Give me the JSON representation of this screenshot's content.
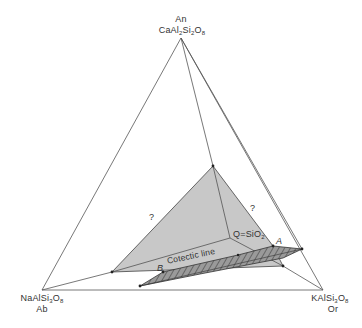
{
  "diagram": {
    "type": "ternary-phase-diagram",
    "apexes": {
      "top": {
        "short": "An",
        "formula_parts": [
          "CaAl",
          "2",
          "Si",
          "2",
          "O",
          "8"
        ]
      },
      "left": {
        "short": "Ab",
        "formula_parts": [
          "NaAlSi",
          "3",
          "O",
          "8"
        ]
      },
      "right": {
        "short": "Or",
        "formula_parts": [
          "KAlSi",
          "3",
          "O",
          "8"
        ]
      }
    },
    "labels": {
      "q": "Q=SiO",
      "q_sub": "2",
      "cotectic": "Cotectic line",
      "point_a": "A",
      "point_b": "B",
      "unknown_left": "?",
      "unknown_right": "?"
    },
    "colors": {
      "line": "#555555",
      "grey_fill": "#c8c8c8",
      "band_fill": "#8a8a8a",
      "hatch": "#333333"
    }
  }
}
